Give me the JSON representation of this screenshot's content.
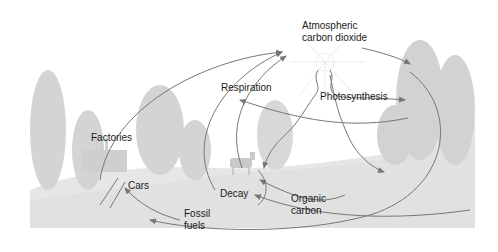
{
  "diagram": {
    "colors": {
      "background": "#ffffff",
      "ground": "#e4e4e4",
      "foliage": "#d2d2d2",
      "arrow": "#777777",
      "text": "#1a1a1a"
    },
    "labels": {
      "atmospheric_line1": "Atmospheric",
      "atmospheric_line2": "carbon dioxide",
      "respiration": "Respiration",
      "photosynthesis": "Photosynthesis",
      "factories": "Factories",
      "cars": "Cars",
      "decay": "Decay",
      "organic_line1": "Organic",
      "organic_line2": "carbon",
      "fossil_line1": "Fossil",
      "fossil_line2": "fuels"
    }
  }
}
